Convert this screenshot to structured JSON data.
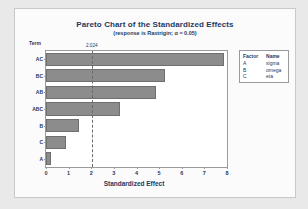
{
  "chart_data": {
    "type": "bar",
    "orientation": "horizontal",
    "title": "Pareto Chart of the Standardized Effects",
    "subtitle": "(response is Rastrigin; α = 0.05)",
    "xlabel": "Standardized Effect",
    "ylabel": "Term",
    "categories": [
      "AC",
      "BC",
      "AB",
      "ABC",
      "B",
      "C",
      "A"
    ],
    "values": [
      7.85,
      5.25,
      4.85,
      3.25,
      1.45,
      0.9,
      0.2
    ],
    "xlim": [
      0,
      8
    ],
    "xticks": [
      "0",
      "1",
      "2",
      "3",
      "4",
      "5",
      "6",
      "7",
      "8"
    ],
    "grid": false,
    "reference_line": {
      "value": 2.024,
      "label": "2.024",
      "style": "dashed"
    },
    "legend": {
      "position": "right",
      "headers": [
        "Factor",
        "Name"
      ],
      "rows": [
        {
          "factor": "A",
          "name": "sigma"
        },
        {
          "factor": "B",
          "name": "omega"
        },
        {
          "factor": "C",
          "name": "eta"
        }
      ]
    },
    "colors": {
      "bar_fill": "#8c8c8c",
      "bar_edge": "#6f6f6f",
      "text": "#1f3864",
      "plot_background": "#ffffff",
      "figure_background": "#fbfbfb",
      "page_background": "#e9e9e9",
      "reference_line": "#6a6a6a"
    }
  }
}
